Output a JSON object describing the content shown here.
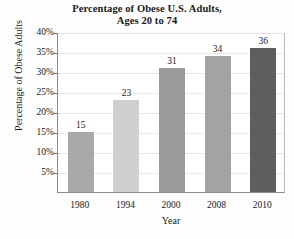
{
  "chart_data": {
    "type": "bar",
    "title": "Percentage of Obese U.S. Adults, Ages 20 to 74",
    "title_line1": "Percentage of Obese U.S. Adults,",
    "title_line2": "Ages 20 to 74",
    "xlabel": "Year",
    "ylabel": "Percentage of Obese Adults",
    "categories": [
      "1980",
      "1994",
      "2000",
      "2008",
      "2010"
    ],
    "values": [
      15,
      23,
      31,
      34,
      36
    ],
    "data_labels": [
      "15",
      "23",
      "31",
      "34",
      "36"
    ],
    "ylim": [
      0,
      40
    ],
    "ytick_labels": [
      "40%",
      "35%",
      "30%",
      "25%",
      "20%",
      "15%",
      "10%",
      "5%"
    ],
    "ytick_values": [
      40,
      35,
      30,
      25,
      20,
      15,
      10,
      5
    ],
    "grid": true,
    "legend": "none",
    "bar_colors": [
      "#a9a9a9",
      "#cfcfcf",
      "#9a9a9a",
      "#a3a3a3",
      "#5e5e5e"
    ],
    "axis_color": "#8a8a8a",
    "grid_color": "#d8d8d8",
    "background": "#ffffff"
  }
}
